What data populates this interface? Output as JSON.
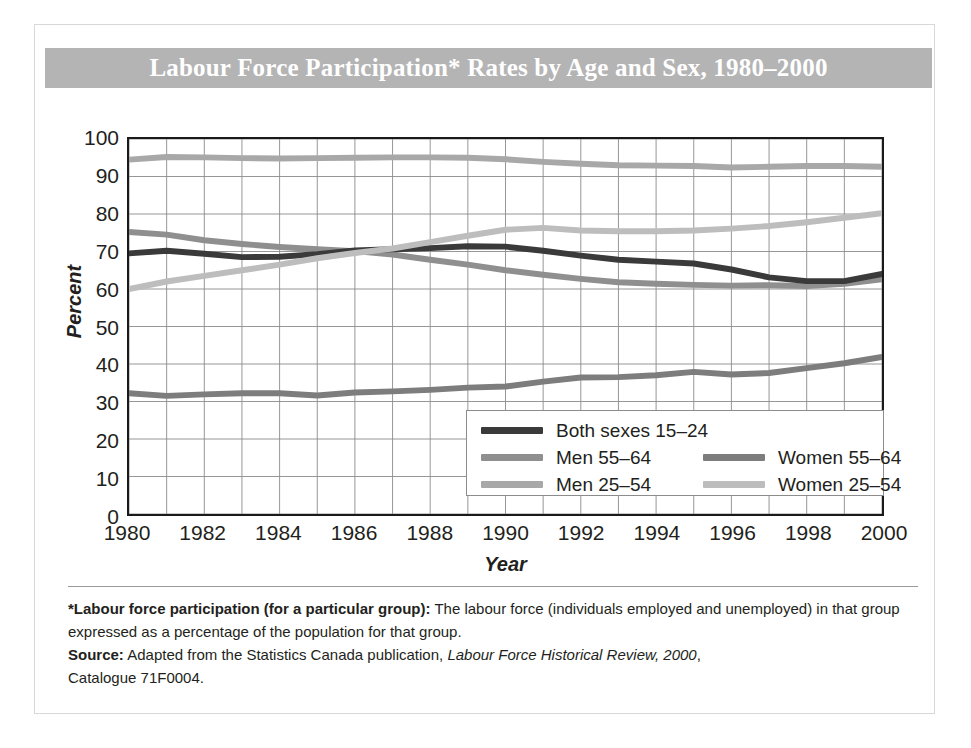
{
  "figure": {
    "title": "Labour Force Participation* Rates by Age and Sex, 1980–2000",
    "banner_color": "#b4b4b4",
    "title_color": "#ffffff"
  },
  "axes": {
    "ylabel": "Percent",
    "xlabel": "Year",
    "yticks": [
      "100",
      "90",
      "80",
      "70",
      "60",
      "50",
      "40",
      "30",
      "20",
      "10",
      "0"
    ],
    "xticks": [
      "1980",
      "1982",
      "1984",
      "1986",
      "1988",
      "1990",
      "1992",
      "1994",
      "1996",
      "1998",
      "2000"
    ]
  },
  "legend": {
    "items": [
      {
        "label": "Both sexes 15–24",
        "color": "#3a3a3a",
        "col": 0,
        "row": 0
      },
      {
        "label": "Men 55–64",
        "color": "#8f8f8f",
        "col": 0,
        "row": 1
      },
      {
        "label": "Men 25–54",
        "color": "#a8a8a8",
        "col": 0,
        "row": 2
      },
      {
        "label": "Women 55–64",
        "color": "#7d7d7d",
        "col": 1,
        "row": 1
      },
      {
        "label": "Women 25–54",
        "color": "#bdbdbd",
        "col": 1,
        "row": 2
      }
    ]
  },
  "footnote": {
    "line1_bold": "*Labour force participation (for a particular group):",
    "line1_rest": "  The labour force (individuals employed and unemployed) in that group expressed as a percentage of the population for that group.",
    "line2_bold": "Source:",
    "line2_rest": " Adapted from the Statistics Canada publication, ",
    "line2_italic": "Labour Force Historical Review, 2000",
    "line2_tail": ",",
    "line3": "Catalogue 71F0004."
  },
  "chart_data": {
    "type": "line",
    "title": "Labour Force Participation* Rates by Age and Sex, 1980–2000",
    "xlabel": "Year",
    "ylabel": "Percent",
    "xlim": [
      1980,
      2000
    ],
    "ylim": [
      0,
      100
    ],
    "grid": true,
    "legend_position": "inside-bottom-right",
    "x": [
      1980,
      1981,
      1982,
      1983,
      1984,
      1985,
      1986,
      1987,
      1988,
      1989,
      1990,
      1991,
      1992,
      1993,
      1994,
      1995,
      1996,
      1997,
      1998,
      1999,
      2000
    ],
    "series": [
      {
        "name": "Men 25–54",
        "color": "#a8a8a8",
        "values": [
          94.5,
          95.2,
          95.1,
          94.9,
          94.8,
          94.9,
          95.0,
          95.1,
          95.1,
          95.0,
          94.6,
          93.9,
          93.4,
          93.0,
          92.9,
          92.8,
          92.4,
          92.6,
          92.8,
          92.8,
          92.6
        ]
      },
      {
        "name": "Men 55–64",
        "color": "#8f8f8f",
        "values": [
          75.2,
          74.5,
          73.0,
          72.0,
          71.2,
          70.6,
          70.1,
          69.2,
          67.8,
          66.5,
          65.0,
          63.8,
          62.7,
          61.8,
          61.4,
          61.1,
          60.9,
          61.0,
          60.8,
          61.4,
          62.6
        ]
      },
      {
        "name": "Both sexes 15–24",
        "color": "#3a3a3a",
        "values": [
          69.5,
          70.2,
          69.4,
          68.5,
          68.6,
          69.3,
          70.3,
          70.6,
          70.9,
          71.4,
          71.3,
          70.2,
          68.9,
          67.8,
          67.3,
          66.8,
          65.2,
          63.1,
          62.1,
          62.1,
          64.0
        ]
      },
      {
        "name": "Women 25–54",
        "color": "#bdbdbd",
        "values": [
          60.0,
          62.0,
          63.5,
          65.0,
          66.5,
          68.2,
          69.6,
          70.8,
          72.5,
          74.2,
          75.8,
          76.3,
          75.6,
          75.4,
          75.4,
          75.6,
          76.1,
          76.8,
          77.8,
          79.0,
          80.2
        ]
      },
      {
        "name": "Women 55–64",
        "color": "#7d7d7d",
        "values": [
          32.2,
          31.5,
          31.9,
          32.2,
          32.2,
          31.6,
          32.4,
          32.7,
          33.1,
          33.7,
          34.0,
          35.3,
          36.4,
          36.5,
          37.0,
          37.9,
          37.2,
          37.6,
          38.9,
          40.2,
          41.9
        ]
      }
    ]
  }
}
